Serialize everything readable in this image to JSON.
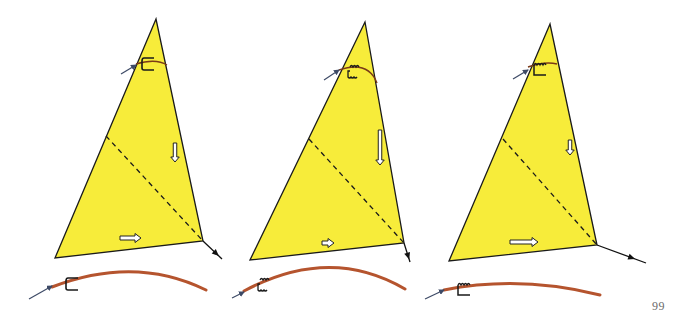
{
  "page": {
    "number": "99",
    "background": "#ffffff"
  },
  "colors": {
    "sail_fill": "#f7ec3a",
    "sail_outline": "#1a1a1a",
    "boom_curve": "#b5542e",
    "inflow_arrow": "#3d4a66",
    "outflow_arrow": "#111111",
    "telltale": "#1a1a1a",
    "flow_arrow_fill": "#ffffff"
  },
  "sails": [
    {
      "id": "sail-1",
      "apex": [
        156,
        19
      ],
      "tack": [
        55,
        258
      ],
      "clew": [
        203,
        241
      ],
      "dashed_start": [
        106,
        136
      ],
      "top_curve": {
        "from": [
          136,
          64
        ],
        "ctrl": [
          156,
          58
        ],
        "to": [
          167,
          65
        ]
      },
      "top_inflow_arrow": {
        "from": [
          121,
          74
        ],
        "to": [
          136,
          65
        ]
      },
      "top_telltale": {
        "type": "straight",
        "x": 142,
        "y": 58
      },
      "leech_flow_arrow": {
        "x": 175,
        "y1": 143,
        "y2": 162,
        "length": "medium"
      },
      "foot_flow_arrow": {
        "x1": 120,
        "x2": 141,
        "y": 238,
        "length": "medium"
      },
      "clew_arrow": {
        "from": [
          203,
          241
        ],
        "to": [
          222,
          259
        ]
      },
      "boom_curve": {
        "from": [
          52,
          287
        ],
        "ctrl": [
          135,
          255
        ],
        "to": [
          206,
          290
        ]
      },
      "boom_inflow_arrow": {
        "from": [
          29,
          299
        ],
        "to": [
          52,
          286
        ]
      },
      "boom_telltale": {
        "type": "straight",
        "x": 66,
        "y": 278
      }
    },
    {
      "id": "sail-2",
      "apex": [
        365,
        22
      ],
      "tack": [
        250,
        260
      ],
      "clew": [
        404,
        243
      ],
      "dashed_start": [
        309,
        139
      ],
      "top_curve": {
        "from": [
          339,
          70
        ],
        "ctrl": [
          368,
          60
        ],
        "to": [
          377,
          83
        ]
      },
      "top_inflow_arrow": {
        "from": [
          324,
          80
        ],
        "to": [
          339,
          70
        ]
      },
      "top_telltale": {
        "type": "wavy",
        "x": 347,
        "y": 65
      },
      "leech_flow_arrow": {
        "x": 380,
        "y1": 130,
        "y2": 165,
        "length": "long"
      },
      "foot_flow_arrow": {
        "x1": 322,
        "x2": 334,
        "y": 243,
        "length": "short"
      },
      "clew_arrow": {
        "from": [
          404,
          243
        ],
        "to": [
          410,
          262
        ]
      },
      "boom_curve": {
        "from": [
          244,
          291
        ],
        "ctrl": [
          330,
          245
        ],
        "to": [
          405,
          289
        ]
      },
      "boom_inflow_arrow": {
        "from": [
          232,
          298
        ],
        "to": [
          244,
          292
        ]
      },
      "boom_telltale": {
        "type": "wavy",
        "x": 257,
        "y": 278
      }
    },
    {
      "id": "sail-3",
      "apex": [
        550,
        24
      ],
      "tack": [
        449,
        261
      ],
      "clew": [
        597,
        245
      ],
      "dashed_start": [
        503,
        139
      ],
      "top_curve": {
        "from": [
          528,
          67
        ],
        "ctrl": [
          545,
          61
        ],
        "to": [
          557,
          64
        ]
      },
      "top_inflow_arrow": {
        "from": [
          513,
          79
        ],
        "to": [
          528,
          70
        ]
      },
      "top_telltale": {
        "type": "wavy-straight",
        "x": 532,
        "y": 62
      },
      "leech_flow_arrow": {
        "x": 570,
        "y1": 140,
        "y2": 155,
        "length": "short"
      },
      "foot_flow_arrow": {
        "x1": 510,
        "x2": 538,
        "y": 242,
        "length": "long"
      },
      "clew_arrow": {
        "from": [
          597,
          245
        ],
        "to": [
          646,
          263
        ]
      },
      "boom_curve": {
        "from": [
          444,
          290
        ],
        "ctrl": [
          520,
          275
        ],
        "to": [
          600,
          295
        ]
      },
      "boom_inflow_arrow": {
        "from": [
          425,
          299
        ],
        "to": [
          444,
          290
        ]
      },
      "boom_telltale": {
        "type": "wavy-straight",
        "x": 456,
        "y": 282
      }
    }
  ]
}
